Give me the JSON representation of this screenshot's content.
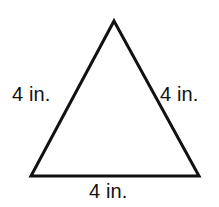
{
  "figure": {
    "name": "equilateral-triangle-with-side-labels",
    "shape": "triangle",
    "background_color": "#ffffff",
    "stroke_color": "#111111",
    "stroke_width_px": 3,
    "text_color": "#111111",
    "vertices": {
      "apex": [
        114,
        21
      ],
      "bottom_left": [
        31,
        176
      ],
      "bottom_right": [
        199,
        176
      ]
    },
    "labels": {
      "left": "4 in.",
      "right": "4 in.",
      "bottom": "4 in."
    },
    "measurement_value": "4",
    "measurement_unit": "in."
  }
}
